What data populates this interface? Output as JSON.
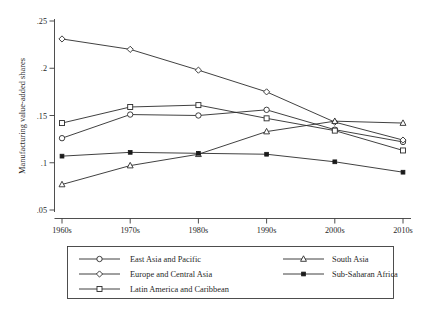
{
  "chart_data": {
    "type": "line",
    "title": "",
    "subtitle": "",
    "xlabel": "",
    "ylabel": "Manufacturing value-added shares",
    "categories": [
      "1960s",
      "1970s",
      "1980s",
      "1990s",
      "2000s",
      "2010s"
    ],
    "x_tick_labels": [
      "1960s",
      "1970s",
      "1980s",
      "1990s",
      "2000s",
      "2010s"
    ],
    "y_tick_labels": [
      ".05",
      ".1",
      ".15",
      ".2",
      ".25"
    ],
    "y_tick_values": [
      0.05,
      0.1,
      0.15,
      0.2,
      0.25
    ],
    "ylim": [
      0.05,
      0.25
    ],
    "grid": false,
    "legend_position": "bottom",
    "legend_columns": 2,
    "series": [
      {
        "name": "East Asia and Pacific",
        "marker": "circle-open",
        "color": "#2b2b2b",
        "values": [
          0.126,
          0.151,
          0.15,
          0.156,
          0.135,
          0.122
        ]
      },
      {
        "name": "Europe and Central Asia",
        "marker": "diamond-open",
        "color": "#2b2b2b",
        "values": [
          0.231,
          0.22,
          0.198,
          0.175,
          0.143,
          0.124
        ]
      },
      {
        "name": "Latin America and Caribbean",
        "marker": "square-open",
        "color": "#2b2b2b",
        "values": [
          0.142,
          0.159,
          0.161,
          0.147,
          0.134,
          0.113
        ]
      },
      {
        "name": "South Asia",
        "marker": "triangle-open",
        "color": "#2b2b2b",
        "values": [
          0.077,
          0.097,
          0.109,
          0.133,
          0.144,
          0.142
        ]
      },
      {
        "name": "Sub-Saharan Africa",
        "marker": "square-filled",
        "color": "#1a1a1a",
        "values": [
          0.107,
          0.111,
          0.11,
          0.109,
          0.101,
          0.09
        ]
      }
    ]
  },
  "axis": {
    "y_title": "Manufacturing value-added shares",
    "y_ticks": [
      ".25",
      ".2",
      ".15",
      ".1",
      ".05"
    ],
    "x_ticks": [
      "1960s",
      "1970s",
      "1980s",
      "1990s",
      "2000s",
      "2010s"
    ]
  },
  "legend": {
    "entries": [
      {
        "label": "East Asia and Pacific",
        "marker": "circle-open"
      },
      {
        "label": "Europe and Central Asia",
        "marker": "diamond-open"
      },
      {
        "label": "Latin America and Caribbean",
        "marker": "square-open"
      },
      {
        "label": "South Asia",
        "marker": "triangle-open"
      },
      {
        "label": "Sub-Saharan Africa",
        "marker": "square-filled"
      }
    ]
  }
}
